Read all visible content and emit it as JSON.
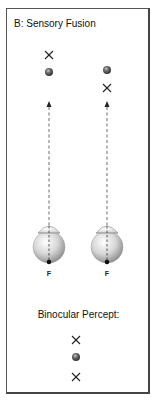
{
  "panel": {
    "title": "B: Sensory Fusion",
    "percept_label": "Binocular Percept:"
  },
  "eyes": [
    {
      "side": "left",
      "fovea_label": "F",
      "cx": 49,
      "targets": [
        {
          "type": "cross",
          "y": 55
        },
        {
          "type": "ball",
          "y": 72
        }
      ]
    },
    {
      "side": "right",
      "fovea_label": "F",
      "cx": 107,
      "targets": [
        {
          "type": "ball",
          "y": 70
        },
        {
          "type": "cross",
          "y": 88
        }
      ]
    }
  ],
  "percept": [
    {
      "type": "cross",
      "y": 340
    },
    {
      "type": "ball",
      "y": 357
    },
    {
      "type": "cross",
      "y": 377
    }
  ],
  "colors": {
    "frame": "#555555",
    "ball": "#444444",
    "cross": "#222222",
    "eye": "#bdbdbd"
  }
}
